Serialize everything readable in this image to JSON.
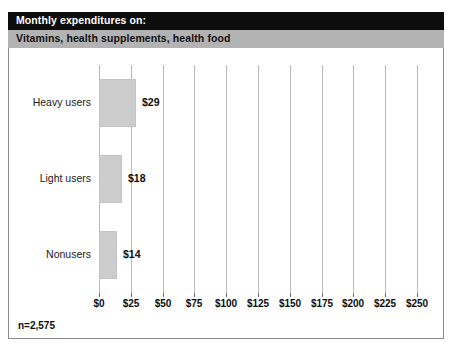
{
  "header": {
    "title": "Monthly expenditures on:",
    "subtitle": "Vitamins, health supplements, health food",
    "title_band_color": "#0d0d0d",
    "subtitle_band_color": "#b3b3b3"
  },
  "footnote": {
    "text": "n=2,575"
  },
  "chart_data": {
    "type": "bar",
    "orientation": "horizontal",
    "title": "Monthly expenditures on:",
    "subtitle": "Vitamins, health supplements, health food",
    "categories": [
      "Heavy users",
      "Light users",
      "Nonusers"
    ],
    "values": [
      29,
      18,
      14
    ],
    "value_labels": [
      "$29",
      "$18",
      "$14"
    ],
    "xlabel": "",
    "ylabel": "",
    "xlim": [
      0,
      250
    ],
    "xticks": [
      0,
      25,
      50,
      75,
      100,
      125,
      150,
      175,
      200,
      225,
      250
    ],
    "xticklabels": [
      "$0",
      "$25",
      "$50",
      "$75",
      "$100",
      "$125",
      "$150",
      "$175",
      "$200",
      "$225",
      "$250"
    ],
    "grid": true,
    "grid_axis": "x",
    "legend": false,
    "bar_color": "#cccccc",
    "gridline_color": "#b9b9b9",
    "note": "n=2,575"
  }
}
